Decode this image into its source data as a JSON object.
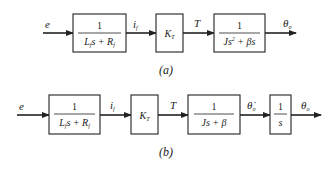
{
  "diagrams": [
    {
      "caption": "(a)",
      "input_signal": "e",
      "blocks": [
        {
          "numerator": "1",
          "denominator": "L_f s + R_f",
          "out_signal": "i_f"
        },
        {
          "gain": "K_T",
          "out_signal": "T"
        },
        {
          "numerator": "1",
          "denominator": "Js^2 + βs",
          "out_signal": "θ_o"
        }
      ]
    },
    {
      "caption": "(b)",
      "input_signal": "e",
      "blocks": [
        {
          "numerator": "1",
          "denominator": "L_f s + R_f",
          "out_signal": "i_f"
        },
        {
          "gain": "K_T",
          "out_signal": "T"
        },
        {
          "numerator": "1",
          "denominator": "Js + β",
          "out_signal": "θ̇_o"
        },
        {
          "numerator": "1",
          "denominator": "s",
          "out_signal": "θ_o"
        }
      ]
    }
  ],
  "text": {
    "a_caption": "(a)",
    "b_caption": "(b)",
    "e": "e",
    "one": "1",
    "i": "i",
    "f": "f",
    "T": "T",
    "K": "K",
    "Tsub": "T",
    "theta": "θ",
    "o": "o",
    "L": "L",
    "R": "R",
    "s_plus": "s + ",
    "J": "J",
    "s": "s",
    "two": "2",
    "beta_s": " + βs",
    "beta": " + β",
    "theta_dot": "θ̇"
  },
  "colors": {
    "line": "#222222",
    "background": "#ffffff"
  }
}
